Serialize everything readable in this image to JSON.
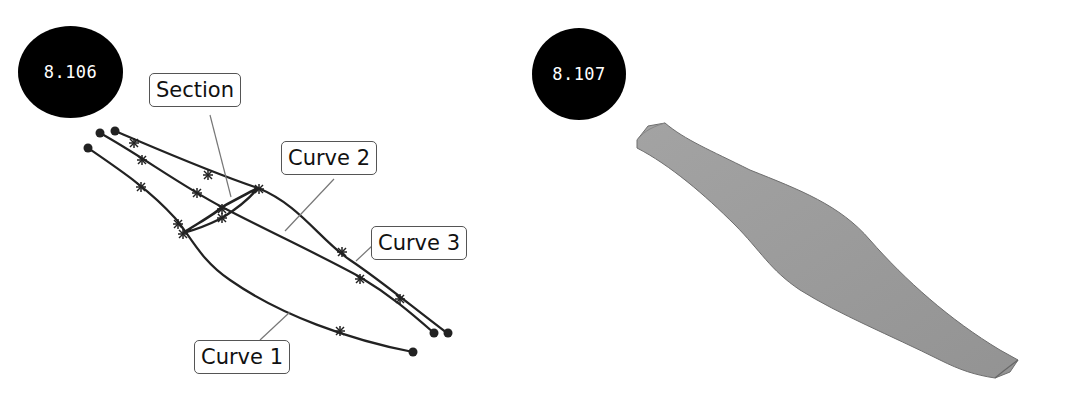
{
  "figures": [
    {
      "id": "8.106",
      "badge_label": "8.106",
      "description": "Wireframe of three curves with a section profile",
      "callouts": {
        "section": "Section",
        "curve2": "Curve 2",
        "curve3": "Curve 3",
        "curve1": "Curve 1"
      }
    },
    {
      "id": "8.107",
      "badge_label": "8.107",
      "description": "Resulting shaded swept surface"
    }
  ],
  "colors": {
    "badge_bg": "#000000",
    "badge_text": "#ffffff",
    "curve_stroke": "#222222",
    "leader_stroke": "#777777",
    "surface_fill": "#9a9a9a",
    "surface_edge": "#6e6e6e"
  }
}
